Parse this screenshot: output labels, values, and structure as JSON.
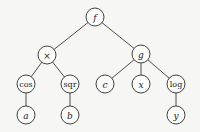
{
  "diagram": {
    "type": "expression-tree",
    "nodes": [
      {
        "id": "f",
        "label": "f",
        "italic": true,
        "x": 95,
        "y": 17,
        "r": 9
      },
      {
        "id": "mul",
        "label": "×",
        "italic": false,
        "x": 47,
        "y": 55,
        "r": 9
      },
      {
        "id": "g",
        "label": "g",
        "italic": true,
        "x": 141,
        "y": 54,
        "r": 9
      },
      {
        "id": "cos",
        "label": "cos",
        "italic": false,
        "x": 26,
        "y": 84,
        "r": 9
      },
      {
        "id": "sqr",
        "label": "sqr",
        "italic": false,
        "x": 70,
        "y": 84,
        "r": 9
      },
      {
        "id": "c",
        "label": "c",
        "italic": true,
        "x": 105,
        "y": 84,
        "r": 9
      },
      {
        "id": "x",
        "label": "x",
        "italic": true,
        "x": 141,
        "y": 84,
        "r": 9
      },
      {
        "id": "log",
        "label": "log",
        "italic": false,
        "x": 176,
        "y": 84,
        "r": 9
      },
      {
        "id": "a",
        "label": "a",
        "italic": true,
        "x": 26,
        "y": 115,
        "r": 9
      },
      {
        "id": "b",
        "label": "b",
        "italic": true,
        "x": 70,
        "y": 115,
        "r": 9
      },
      {
        "id": "y",
        "label": "y",
        "italic": true,
        "x": 176,
        "y": 115,
        "r": 9
      }
    ],
    "edges": [
      [
        "f",
        "mul"
      ],
      [
        "f",
        "g"
      ],
      [
        "mul",
        "cos"
      ],
      [
        "mul",
        "sqr"
      ],
      [
        "g",
        "c"
      ],
      [
        "g",
        "x"
      ],
      [
        "g",
        "log"
      ],
      [
        "cos",
        "a"
      ],
      [
        "sqr",
        "b"
      ],
      [
        "log",
        "y"
      ]
    ]
  }
}
